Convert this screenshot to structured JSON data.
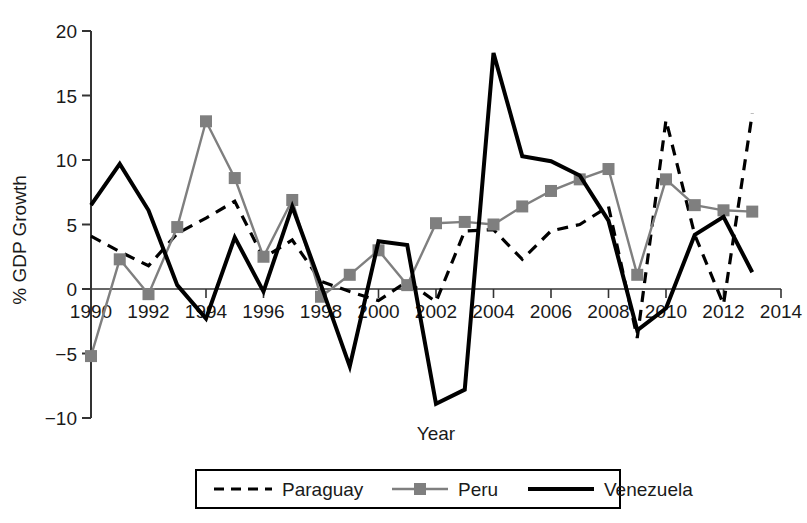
{
  "chart_data": {
    "type": "line",
    "title": "",
    "xlabel": "Year",
    "ylabel": "% GDP Growth",
    "xlim": [
      1990,
      2014
    ],
    "ylim": [
      -10,
      20
    ],
    "xticks": [
      1990,
      1992,
      1994,
      1996,
      1998,
      2000,
      2002,
      2004,
      2006,
      2008,
      2010,
      2012,
      2014
    ],
    "xtick_labels": [
      "1990",
      "1992",
      "1994",
      "1996",
      "1998",
      "2000",
      "2002",
      "2004",
      "2006",
      "2008",
      "2010",
      "2012",
      "2014"
    ],
    "yticks": [
      -10,
      -5,
      0,
      5,
      10,
      15,
      20
    ],
    "ytick_labels": [
      "−10",
      "−5",
      "0",
      "5",
      "10",
      "15",
      "20"
    ],
    "x": [
      1990,
      1991,
      1992,
      1993,
      1994,
      1995,
      1996,
      1997,
      1998,
      1999,
      2000,
      2001,
      2002,
      2003,
      2004,
      2005,
      2006,
      2007,
      2008,
      2009,
      2010,
      2011,
      2012,
      2013
    ],
    "grid": false,
    "legend_position": "below-center",
    "series": [
      {
        "name": "Paraguay",
        "style": "dashed",
        "color": "#000000",
        "marker": "none",
        "values": [
          4.1,
          2.9,
          1.8,
          4.3,
          5.5,
          6.8,
          2.4,
          3.8,
          0.6,
          -0.2,
          -0.9,
          0.6,
          -1.0,
          4.5,
          4.6,
          2.3,
          4.5,
          5.0,
          6.4,
          -3.8,
          13.1,
          4.2,
          -1.2,
          13.6
        ]
      },
      {
        "name": "Peru",
        "style": "solid",
        "color": "#7f7f7f",
        "marker": "square",
        "values": [
          -5.2,
          2.3,
          -0.4,
          4.8,
          13.0,
          8.6,
          2.5,
          6.9,
          -0.6,
          1.1,
          3.0,
          0.3,
          5.1,
          5.2,
          5.0,
          6.4,
          7.6,
          8.5,
          9.3,
          1.1,
          8.5,
          6.5,
          6.1,
          6.0
        ]
      },
      {
        "name": "Venezuela",
        "style": "solid-thick",
        "color": "#000000",
        "marker": "none",
        "values": [
          6.5,
          9.7,
          6.1,
          0.3,
          -2.3,
          4.0,
          -0.2,
          6.4,
          0.3,
          -6.0,
          3.7,
          3.4,
          -8.9,
          -7.8,
          18.3,
          10.3,
          9.9,
          8.8,
          5.3,
          -3.2,
          -1.5,
          4.2,
          5.6,
          1.3
        ]
      }
    ]
  },
  "legend": {
    "items": [
      {
        "label": "Paraguay",
        "swatch": "dashed-line-swatch"
      },
      {
        "label": "Peru",
        "swatch": "gray-line-square-marker-swatch"
      },
      {
        "label": "Venezuela",
        "swatch": "thick-solid-line-swatch"
      }
    ]
  }
}
